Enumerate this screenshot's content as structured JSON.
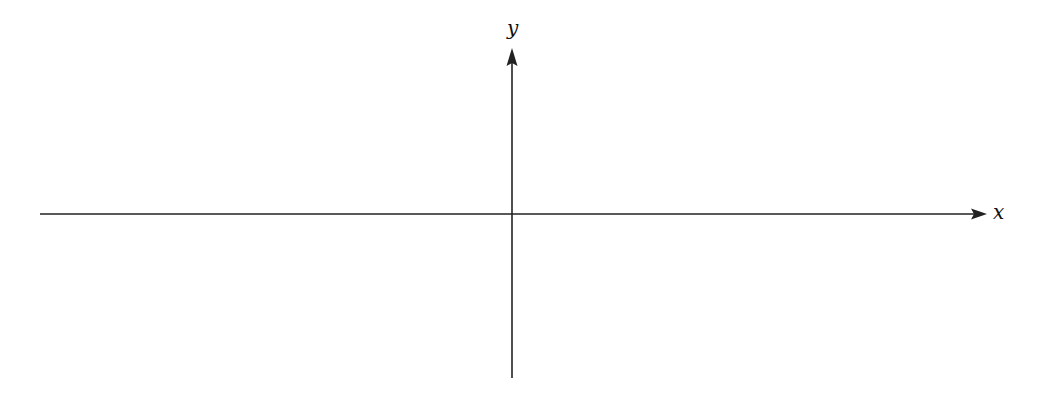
{
  "diagram": {
    "type": "cartesian-axes",
    "x_axis": {
      "label": "x",
      "start": [
        40,
        214
      ],
      "end": [
        986,
        214
      ],
      "arrow": "right"
    },
    "y_axis": {
      "label": "y",
      "start": [
        512,
        378
      ],
      "end": [
        512,
        50
      ],
      "arrow": "up"
    },
    "origin": [
      512,
      214
    ],
    "colors": {
      "line": "#222222",
      "label": "#111111",
      "background": "#ffffff"
    }
  }
}
